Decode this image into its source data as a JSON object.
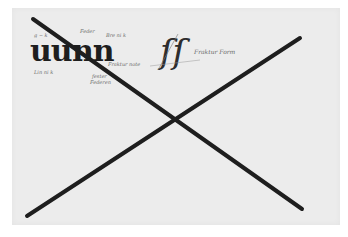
{
  "image": {
    "description": "Scanned calligraphy study sheet with blackletter letterforms and handwritten notes, crossed out by a large hand-drawn X",
    "background_color": "#ffffff",
    "paper_color": "#ececec",
    "ink_color": "#1e1e1e"
  },
  "letterforms": {
    "left_group_1": "uu",
    "left_group_2": "nn",
    "right_glyph": "ſſ"
  },
  "annotations": {
    "note_top_left": "g ~ k",
    "note_top_mid": "Feder",
    "note_top_right": "Bre ni k",
    "note_left_bottom": "Lin ni k",
    "note_mid_right": "Fraktur note",
    "note_mid_bottom_1": "fester",
    "note_mid_bottom_2": "Federen",
    "note_right_glyph": "Fraktur Form"
  },
  "cross_mark": {
    "stroke_1": {
      "x1": 33,
      "y1": 19,
      "x2": 302,
      "y2": 209
    },
    "stroke_2": {
      "x1": 27,
      "y1": 216,
      "x2": 300,
      "y2": 38
    },
    "stroke_width": 4
  }
}
